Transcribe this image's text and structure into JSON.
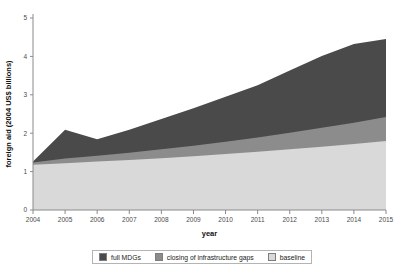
{
  "chart_data": {
    "type": "area",
    "stacked": true,
    "title": "",
    "xlabel": "year",
    "ylabel": "foreign aid (2004 US$ billions)",
    "x": [
      2004,
      2005,
      2006,
      2007,
      2008,
      2009,
      2010,
      2011,
      2012,
      2013,
      2014,
      2015
    ],
    "xtick_labels": [
      "2004",
      "2005",
      "2006",
      "2007",
      "2008",
      "2009",
      "2010",
      "2011",
      "2012",
      "2013",
      "2014",
      "2015"
    ],
    "ytick_labels": [
      "0",
      "1",
      "2",
      "3",
      "4",
      "5"
    ],
    "yticks": [
      0,
      1,
      2,
      3,
      4,
      5
    ],
    "ylim": [
      0,
      5
    ],
    "xlim": [
      2004,
      2015
    ],
    "grid": false,
    "legend_position": "bottom",
    "series": [
      {
        "name": "baseline",
        "color": "#d9d9d9",
        "values": [
          1.18,
          1.22,
          1.26,
          1.3,
          1.35,
          1.4,
          1.46,
          1.52,
          1.58,
          1.65,
          1.72,
          1.8
        ]
      },
      {
        "name": "closing of infrastructure gaps",
        "color": "#8c8c8c",
        "values": [
          0.06,
          0.12,
          0.15,
          0.19,
          0.23,
          0.27,
          0.32,
          0.37,
          0.43,
          0.49,
          0.55,
          0.62
        ]
      },
      {
        "name": "full MDGs",
        "color": "#4a4a4a",
        "values": [
          0.02,
          0.75,
          0.43,
          0.6,
          0.79,
          0.98,
          1.17,
          1.36,
          1.62,
          1.87,
          2.05,
          2.03
        ]
      }
    ],
    "cumulative_tops": {
      "baseline": [
        1.18,
        1.22,
        1.26,
        1.3,
        1.35,
        1.4,
        1.46,
        1.52,
        1.58,
        1.65,
        1.72,
        1.8
      ],
      "infrastructure": [
        1.24,
        1.34,
        1.41,
        1.49,
        1.58,
        1.67,
        1.78,
        1.89,
        2.01,
        2.14,
        2.27,
        2.42
      ],
      "full_mdgs": [
        1.26,
        2.09,
        1.84,
        2.09,
        2.37,
        2.65,
        2.95,
        3.25,
        3.63,
        4.01,
        4.32,
        4.45
      ]
    }
  },
  "legend": {
    "items": [
      {
        "label": "full MDGs",
        "color": "#4a4a4a"
      },
      {
        "label": "closing of infrastructure gaps",
        "color": "#8c8c8c"
      },
      {
        "label": "baseline",
        "color": "#d9d9d9"
      }
    ]
  },
  "footnote": {
    "text": ""
  }
}
